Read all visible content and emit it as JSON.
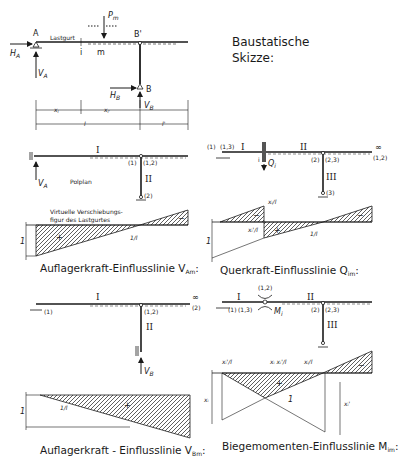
{
  "sketch": {
    "title_line1": "Baustatische",
    "title_line2": "Skizze:",
    "lastgurt": "Lastgurt",
    "A": "A",
    "B": "B",
    "Bp": "B'",
    "HA": "H",
    "HA_sub": "A",
    "VA": "V",
    "VA_sub": "A",
    "HB": "H",
    "HB_sub": "B",
    "VB": "V",
    "VB_sub": "B",
    "Pm": "P",
    "Pm_sub": "m",
    "i": "i",
    "m": "m",
    "xi": "x",
    "xi_sub": "i",
    "xip": "x",
    "xip_sub": "i'",
    "l": "l",
    "lp": "l'"
  },
  "panel_va": {
    "I": "I",
    "II": "II",
    "p1": "(1)",
    "p12": "(1,2)",
    "p2": "(2)",
    "VA": "V",
    "VA_sub": "A",
    "polplan": "Polplan",
    "virt1": "Virtuelle Verschiebungs-",
    "virt2": "figur des Lastgurtes",
    "one": "1",
    "plus": "+",
    "minus": "−",
    "dot": "·",
    "frac": "1/l",
    "caption": "Auflagerkraft-Einflusslinie V",
    "caption_sub": "Am",
    "caption_end": ":"
  },
  "panel_q": {
    "I": "I",
    "II": "II",
    "III": "III",
    "p1": "(1)",
    "p13": "(1,3)",
    "p2": "(2)",
    "p23": "(2,3)",
    "p3": "(3)",
    "inf": "∞",
    "p12": "(1,2)",
    "i": "i",
    "Qi": "Q",
    "Qi_sub": "i",
    "xi_l": "xᵢ/l",
    "xip_l": "xᵢ'/l",
    "one": "1",
    "plus": "+",
    "minus": "−",
    "frac": "1/l",
    "caption": "Querkraft-Einflusslinie Q",
    "caption_sub": "im",
    "caption_end": ":"
  },
  "panel_vb": {
    "I": "I",
    "II": "II",
    "p1": "(1)",
    "p12": "(1,2)",
    "inf": "∞",
    "p2": "(2)",
    "VB": "V",
    "VB_sub": "B",
    "one": "1",
    "plus": "+",
    "frac": "1/l",
    "caption": "Auflagerkraft - Einflusslinie V",
    "caption_sub": "Bm",
    "caption_end": ":"
  },
  "panel_m": {
    "I": "I",
    "II": "II",
    "III": "III",
    "p12": "(1,2)",
    "p1": "(1)",
    "p13": "(1,3)",
    "p2": "(2)",
    "p23": "(2,3)",
    "Mi": "M",
    "Mi_sub": "i",
    "i": "i",
    "xip_l": "xᵢ'/l",
    "xixip_l": "xᵢ xᵢ'/l",
    "xi_l": "xᵢ/l",
    "xi": "xᵢ",
    "xip": "xᵢ'",
    "one": "1",
    "plus": "+",
    "minus": "−",
    "caption": "Biegemomenten-Einflusslinie M",
    "caption_sub": "im",
    "caption_end": ":"
  }
}
